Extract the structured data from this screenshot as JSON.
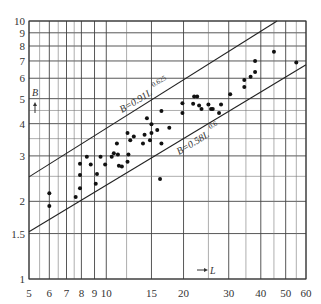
{
  "chart_data": {
    "type": "scatter",
    "title": "",
    "xlabel": "L",
    "ylabel": "B",
    "xscale": "log",
    "yscale": "log",
    "xlim": [
      5,
      60
    ],
    "ylim": [
      1,
      10
    ],
    "grid": true,
    "x_ticks": [
      5,
      6,
      7,
      8,
      9,
      10,
      15,
      20,
      30,
      40,
      50,
      60
    ],
    "x_tick_labels": [
      "5",
      "6",
      "7",
      "8",
      "9",
      "10",
      "15",
      "20",
      "30",
      "40",
      "50",
      "60"
    ],
    "y_ticks": [
      1,
      1.5,
      2,
      3,
      4,
      5,
      6,
      7,
      8,
      9,
      10
    ],
    "y_tick_labels": [
      "1",
      "1.5",
      "2",
      "3",
      "4",
      "5",
      "6",
      "7",
      "8",
      "9",
      "10"
    ],
    "lines": [
      {
        "name": "upper",
        "label": "B=0.91L",
        "exponent_label": "0.625",
        "coef": 0.91,
        "exp": 0.625
      },
      {
        "name": "lower",
        "label": "B=0.58L",
        "exponent_label": "0.6",
        "coef": 0.58,
        "exp": 0.6
      }
    ],
    "points": [
      {
        "x": 6.0,
        "y": 2.15
      },
      {
        "x": 6.0,
        "y": 1.92
      },
      {
        "x": 7.6,
        "y": 2.08
      },
      {
        "x": 7.9,
        "y": 2.25
      },
      {
        "x": 7.9,
        "y": 2.53
      },
      {
        "x": 7.9,
        "y": 2.8
      },
      {
        "x": 8.4,
        "y": 2.98
      },
      {
        "x": 8.7,
        "y": 2.78
      },
      {
        "x": 9.1,
        "y": 2.34
      },
      {
        "x": 9.2,
        "y": 2.55
      },
      {
        "x": 9.5,
        "y": 2.98
      },
      {
        "x": 9.9,
        "y": 2.78
      },
      {
        "x": 10.5,
        "y": 2.98
      },
      {
        "x": 10.7,
        "y": 3.07
      },
      {
        "x": 11.1,
        "y": 3.04
      },
      {
        "x": 11.2,
        "y": 2.75
      },
      {
        "x": 11.5,
        "y": 2.73
      },
      {
        "x": 12.1,
        "y": 2.85
      },
      {
        "x": 12.2,
        "y": 3.04
      },
      {
        "x": 11.0,
        "y": 3.35
      },
      {
        "x": 12.1,
        "y": 3.68
      },
      {
        "x": 12.4,
        "y": 3.45
      },
      {
        "x": 12.8,
        "y": 3.57
      },
      {
        "x": 13.9,
        "y": 3.35
      },
      {
        "x": 14.1,
        "y": 3.62
      },
      {
        "x": 14.4,
        "y": 4.2
      },
      {
        "x": 14.8,
        "y": 3.45
      },
      {
        "x": 15.0,
        "y": 3.68
      },
      {
        "x": 15.0,
        "y": 3.98
      },
      {
        "x": 15.8,
        "y": 3.78
      },
      {
        "x": 16.4,
        "y": 3.35
      },
      {
        "x": 16.4,
        "y": 4.48
      },
      {
        "x": 16.2,
        "y": 2.44
      },
      {
        "x": 17.6,
        "y": 3.86
      },
      {
        "x": 19.8,
        "y": 4.8
      },
      {
        "x": 19.8,
        "y": 4.4
      },
      {
        "x": 21.8,
        "y": 4.78
      },
      {
        "x": 22.0,
        "y": 5.1
      },
      {
        "x": 22.6,
        "y": 5.1
      },
      {
        "x": 23.0,
        "y": 4.7
      },
      {
        "x": 23.5,
        "y": 4.56
      },
      {
        "x": 25.0,
        "y": 4.75
      },
      {
        "x": 25.6,
        "y": 4.56
      },
      {
        "x": 26.0,
        "y": 4.56
      },
      {
        "x": 27.5,
        "y": 4.4
      },
      {
        "x": 28.0,
        "y": 4.75
      },
      {
        "x": 30.4,
        "y": 5.2
      },
      {
        "x": 34.5,
        "y": 5.9
      },
      {
        "x": 34.5,
        "y": 5.55
      },
      {
        "x": 36.5,
        "y": 6.08
      },
      {
        "x": 38.0,
        "y": 6.35
      },
      {
        "x": 38.0,
        "y": 7.0
      },
      {
        "x": 45.0,
        "y": 7.6
      },
      {
        "x": 55.0,
        "y": 6.9
      }
    ],
    "annotations": [
      "B=0.91L^0.625",
      "B=0.58L^0.6"
    ]
  },
  "labels": {
    "x_axis": "L",
    "y_axis": "B",
    "upper_eq": "B=0.91L",
    "upper_exp": "0.625",
    "lower_eq": "B=0.58L",
    "lower_exp": "0.6"
  }
}
